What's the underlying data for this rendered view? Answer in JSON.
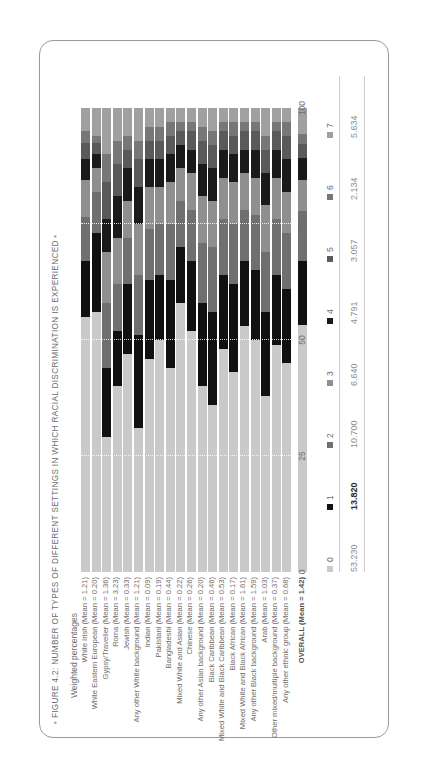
{
  "figure": {
    "title": "FIGURE 4.2: NUMBER OF TYPES OF DIFFERENT SETTINGS IN WHICH RACIAL DISCRIMINATION IS EXPERIENCED",
    "bullet_left": "▪",
    "bullet_right": "▪",
    "axis_title": "Weighted percentages"
  },
  "chart_data": {
    "type": "bar",
    "title": "FIGURE 4.2: NUMBER OF TYPES OF DIFFERENT SETTINGS IN WHICH RACIAL DISCRIMINATION IS EXPERIENCED",
    "subtitle": "",
    "orientation": "horizontal",
    "stacked": true,
    "stack_mode": "percent",
    "xlabel": "Weighted percentages",
    "ylabel": "",
    "xlim": [
      0,
      100
    ],
    "xticks": [
      "0",
      "25",
      "50",
      "75",
      "100"
    ],
    "grid": true,
    "legend_position": "bottom",
    "legend_title": "",
    "series": [
      {
        "name": "0",
        "color": "#c9c9c9"
      },
      {
        "name": "1",
        "color": "#111111"
      },
      {
        "name": "2",
        "color": "#6f6f6f"
      },
      {
        "name": "3",
        "color": "#8f8f8f"
      },
      {
        "name": "4",
        "color": "#1a1a1a"
      },
      {
        "name": "5",
        "color": "#5a5a5a"
      },
      {
        "name": "6",
        "color": "#777777"
      },
      {
        "name": "7",
        "color": "#a0a0a0"
      }
    ],
    "overall_values": [
      "53.230",
      "13.820",
      "10.700",
      "6.640",
      "4.791",
      "3.057",
      "2.134",
      "5.634"
    ],
    "categories": [
      {
        "label": "White Irish (Mean = 1.21)",
        "name": "White Irish",
        "mean": "1.21",
        "values": [
          55.0,
          12.0,
          9.5,
          8.0,
          4.5,
          3.5,
          2.5,
          5.0
        ]
      },
      {
        "label": "White Eastern European (Mean = 0.20)",
        "name": "White Eastern European",
        "mean": "0.20",
        "values": [
          56.0,
          17.0,
          9.0,
          5.0,
          3.0,
          2.5,
          1.5,
          6.0
        ]
      },
      {
        "label": "Gypsy/Traveller (Mean = 1.36)",
        "name": "Gypsy/Traveller",
        "mean": "1.36",
        "values": [
          29.0,
          15.0,
          14.0,
          11.0,
          7.0,
          8.0,
          6.0,
          10.0
        ]
      },
      {
        "label": "Roma (Mean = 3.23)",
        "name": "Roma",
        "mean": "3.23",
        "values": [
          40.0,
          12.0,
          10.0,
          10.0,
          9.0,
          7.0,
          5.0,
          7.0
        ]
      },
      {
        "label": "Jewish (Mean = 0.33)",
        "name": "Jewish",
        "mean": "0.33",
        "values": [
          47.0,
          15.0,
          10.0,
          8.0,
          7.0,
          4.0,
          3.0,
          6.0
        ]
      },
      {
        "label": "Any other White background (Mean = 1.21)",
        "name": "Any other White background",
        "mean": "1.21",
        "values": [
          31.0,
          20.0,
          13.0,
          11.0,
          8.0,
          6.0,
          4.0,
          7.0
        ]
      },
      {
        "label": "Indian (Mean = 0.09)",
        "name": "Indian",
        "mean": "0.09",
        "values": [
          46.0,
          17.0,
          11.0,
          9.0,
          6.0,
          4.0,
          3.0,
          4.0
        ]
      },
      {
        "label": "Pakistani (Mean = 0.19)",
        "name": "Pakistani",
        "mean": "0.19",
        "values": [
          50.0,
          14.0,
          11.0,
          8.0,
          6.0,
          4.0,
          3.0,
          4.0
        ]
      },
      {
        "label": "Bangladeshi (Mean = 0.44)",
        "name": "Bangladeshi",
        "mean": "0.44",
        "values": [
          44.0,
          19.0,
          12.0,
          9.0,
          6.0,
          4.0,
          3.0,
          3.0
        ]
      },
      {
        "label": "Mixed White and Asian (Mean = 0.22)",
        "name": "Mixed White and Asian",
        "mean": "0.22",
        "values": [
          58.0,
          12.0,
          10.0,
          7.0,
          5.0,
          3.0,
          2.0,
          3.0
        ]
      },
      {
        "label": "Chinese (Mean = 0.26)",
        "name": "Chinese",
        "mean": "0.26",
        "values": [
          52.0,
          15.0,
          11.0,
          8.0,
          5.0,
          4.0,
          2.0,
          3.0
        ]
      },
      {
        "label": "Any other Asian background (Mean = 0.20)",
        "name": "Any other Asian background",
        "mean": "0.20",
        "values": [
          40.0,
          18.0,
          13.0,
          10.0,
          7.0,
          5.0,
          3.0,
          4.0
        ]
      },
      {
        "label": "Black Caribbean (Mean = 0.46)",
        "name": "Black Caribbean",
        "mean": "0.46",
        "values": [
          36.0,
          20.0,
          14.0,
          10.0,
          7.0,
          5.0,
          3.0,
          5.0
        ]
      },
      {
        "label": "Mixed White and Black Caribbean (Mean = 0.53)",
        "name": "Mixed White and Black Caribbean",
        "mean": "0.53",
        "values": [
          48.0,
          16.0,
          12.0,
          9.0,
          6.0,
          4.0,
          2.0,
          3.0
        ]
      },
      {
        "label": "Black African (Mean = 0.17)",
        "name": "Black African",
        "mean": "0.17",
        "values": [
          43.0,
          19.0,
          13.0,
          9.0,
          6.0,
          4.0,
          3.0,
          3.0
        ]
      },
      {
        "label": "Mixed White and Black African (Mean = 1.61)",
        "name": "Mixed White and Black African",
        "mean": "1.61",
        "values": [
          53.0,
          14.0,
          11.0,
          8.0,
          5.0,
          4.0,
          2.0,
          3.0
        ]
      },
      {
        "label": "Any other Black background (Mean = 1.59)",
        "name": "Any other Black background",
        "mean": "1.59",
        "values": [
          50.0,
          15.0,
          12.0,
          8.0,
          6.0,
          4.0,
          2.0,
          3.0
        ]
      },
      {
        "label": "Arab (Mean = 1.03)",
        "name": "Arab",
        "mean": "1.03",
        "values": [
          38.0,
          18.0,
          13.0,
          10.0,
          7.0,
          5.0,
          3.0,
          6.0
        ]
      },
      {
        "label": "Other mixed/multiple background (Mean = 0.37)",
        "name": "Other mixed/multiple background",
        "mean": "0.37",
        "values": [
          49.0,
          15.0,
          12.0,
          9.0,
          6.0,
          4.0,
          2.0,
          3.0
        ]
      },
      {
        "label": "Any other ethnic group (Mean = 0.68)",
        "name": "Any other ethnic group",
        "mean": "0.68",
        "values": [
          45.0,
          16.0,
          12.0,
          9.0,
          7.0,
          5.0,
          3.0,
          3.0
        ]
      }
    ],
    "overall": {
      "label_line1": "OVERALL",
      "label_line2": "(Mean = 1.42)",
      "values": [
        53.23,
        13.82,
        10.7,
        6.64,
        4.791,
        3.057,
        2.134,
        5.634
      ]
    }
  }
}
